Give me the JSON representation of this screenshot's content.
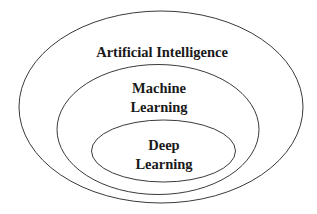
{
  "diagram": {
    "type": "nested-ellipses",
    "stroke_color": "#3a3a3a",
    "text_color": "#1a1a1a",
    "layers": [
      {
        "id": "ai",
        "label": "Artificial Intelligence"
      },
      {
        "id": "ml",
        "label_line1": "Machine",
        "label_line2": "Learning"
      },
      {
        "id": "dl",
        "label_line1": "Deep",
        "label_line2": "Learning"
      }
    ]
  }
}
